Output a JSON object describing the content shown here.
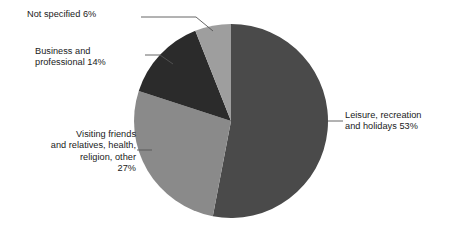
{
  "chart_data": {
    "type": "pie",
    "title": "",
    "subtitle": "",
    "xlabel": "",
    "ylabel": "",
    "legend_position": "none",
    "grid": false,
    "units": "percent",
    "start_angle_deg": 0,
    "direction": "clockwise",
    "categories": [
      "Leisure, recreation and holidays",
      "Visiting friends and relatives, health, religion, other",
      "Business and professional",
      "Not specified"
    ],
    "values": [
      53,
      27,
      14,
      6
    ],
    "colors": [
      "#4a4a4a",
      "#8a8a8a",
      "#2b2b2b",
      "#9e9e9e"
    ],
    "slices": [
      {
        "name": "Leisure, recreation and holidays",
        "value": 53,
        "value_text": "53%",
        "color": "#4a4a4a",
        "label_text": "Leisure, recreation\nand holidays 53%"
      },
      {
        "name": "Visiting friends and relatives, health, religion, other",
        "value": 27,
        "value_text": "27%",
        "color": "#8a8a8a",
        "label_text": "Visiting friends\nand relatives, health,\nreligion, other\n27%"
      },
      {
        "name": "Business and professional",
        "value": 14,
        "value_text": "14%",
        "color": "#2b2b2b",
        "label_text": "Business and\nprofessional 14%"
      },
      {
        "name": "Not specified",
        "value": 6,
        "value_text": "6%",
        "color": "#9e9e9e",
        "label_text": "Not specified 6%"
      }
    ]
  },
  "labels": {
    "leisure": "Leisure, recreation\nand holidays 53%",
    "visiting": "Visiting friends\nand relatives, health,\nreligion, other\n27%",
    "business": "Business and\nprofessional 14%",
    "not_specified": "Not specified 6%"
  },
  "style": {
    "background": "#ffffff",
    "text_color": "#1a1a1a",
    "leader_line_color": "#555555"
  }
}
